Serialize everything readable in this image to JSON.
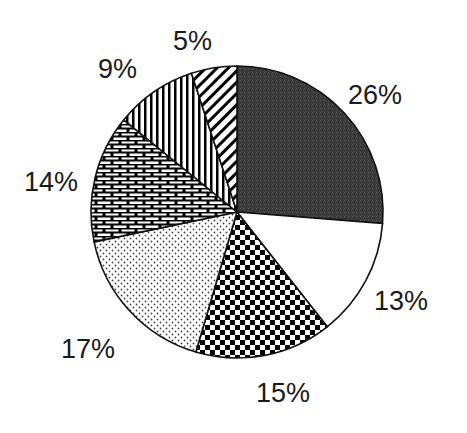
{
  "chart_data": {
    "type": "pie",
    "title": "",
    "start_angle_deg": 0,
    "direction": "clockwise",
    "slices": [
      {
        "label": "26%",
        "value": 26,
        "pattern": "dark-gray-fine-texture",
        "color": "#3a3a3a"
      },
      {
        "label": "13%",
        "value": 13,
        "pattern": "solid-white",
        "color": "#ffffff"
      },
      {
        "label": "15%",
        "value": 15,
        "pattern": "checkerboard",
        "color": "#000000"
      },
      {
        "label": "17%",
        "value": 17,
        "pattern": "dotted",
        "color": "#555555"
      },
      {
        "label": "14%",
        "value": 14,
        "pattern": "brick",
        "color": "#000000"
      },
      {
        "label": "9%",
        "value": 9,
        "pattern": "vertical-stripes",
        "color": "#000000"
      },
      {
        "label": "5%",
        "value": 5,
        "pattern": "diagonal-stripes",
        "color": "#000000"
      }
    ],
    "legend": "none",
    "data_labels": [
      "26%",
      "13%",
      "15%",
      "17%",
      "14%",
      "9%",
      "5%"
    ]
  },
  "labels": {
    "s0": "26%",
    "s1": "13%",
    "s2": "15%",
    "s3": "17%",
    "s4": "14%",
    "s5": "9%",
    "s6": "5%"
  }
}
